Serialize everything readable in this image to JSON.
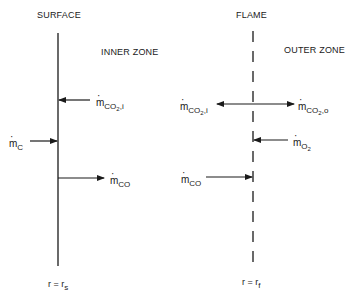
{
  "diagram": {
    "type": "two-zone combustion model (carbon particle surface and flame sheet)",
    "boundaries": {
      "surface": {
        "title": "SURFACE",
        "position_label": "r = r",
        "position_sub": "s",
        "line_style": "solid"
      },
      "flame": {
        "title": "FLAME",
        "position_label": "r = r",
        "position_sub": "f",
        "line_style": "dashed"
      }
    },
    "zones": {
      "inner": "INNER ZONE",
      "outer": "OUTER ZONE"
    },
    "fluxes": {
      "m_c": {
        "symbol": "m",
        "sub": "C",
        "direction": "toward surface"
      },
      "m_co2_i_surface": {
        "symbol": "m",
        "sub": "CO",
        "subsub": "2",
        "tail": ",i",
        "direction": "toward surface"
      },
      "m_co_surface": {
        "symbol": "m",
        "sub": "CO",
        "direction": "away from surface"
      },
      "m_co2_i_flame": {
        "symbol": "m",
        "sub": "CO",
        "subsub": "2",
        "tail": ",i",
        "direction": "inward from flame"
      },
      "m_co2_o_flame": {
        "symbol": "m",
        "sub": "CO",
        "subsub": "2",
        "tail": ",o",
        "direction": "outward from flame"
      },
      "m_o2": {
        "symbol": "m",
        "sub": "O",
        "subsub": "2",
        "direction": "toward flame"
      },
      "m_co_flame": {
        "symbol": "m",
        "sub": "CO",
        "direction": "toward flame"
      }
    },
    "colors": {
      "line": "#1a1a1a",
      "background": "#ffffff"
    }
  }
}
